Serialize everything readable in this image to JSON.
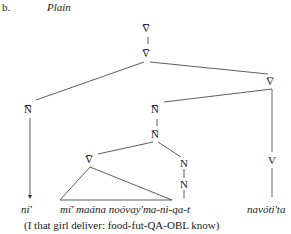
{
  "example": {
    "number": "b.",
    "title": "Plain"
  },
  "tree": {
    "nodes": {
      "root": "V̅̅̅",
      "vbar2": "V̅̅",
      "nbar3_left": "N̅̅̅",
      "vbar1_right": "V̅",
      "nbar3_mid": "N̅̅̅",
      "nbar1_mid": "N̅",
      "vbar2_inner": "V̅̅",
      "n1": "N",
      "n2": "N",
      "v_right": "V"
    },
    "leaves": {
      "left": "ní'",
      "middle": "mí' maána noóvay'ma-ni-qa-t",
      "right": "navóti'ta"
    }
  },
  "gloss": "(I that girl deliver: food-fut-QA-OBL know)"
}
